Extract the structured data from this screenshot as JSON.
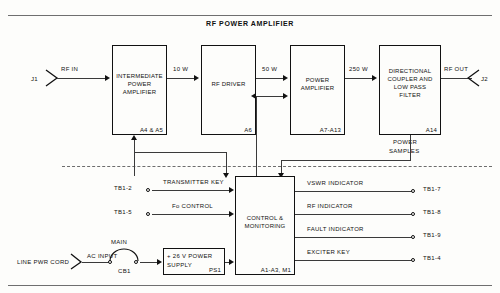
{
  "diagram": {
    "title": "RF POWER AMPLIFIER",
    "type": "block-diagram"
  },
  "signal_chain": {
    "input_connector": "J1",
    "input_label": "RF IN",
    "output_connector": "J2",
    "output_label": "RF OUT",
    "blocks": [
      {
        "id": "ipa",
        "name": "INTERMEDIATE\nPOWER\nAMPLIFIER",
        "line1": "INTERMEDIATE",
        "line2": "POWER",
        "line3": "AMPLIFIER",
        "designator": "A4 & A5"
      },
      {
        "id": "drv",
        "name": "RF DRIVER",
        "line1": "RF DRIVER",
        "line2": "",
        "line3": "",
        "designator": "A6"
      },
      {
        "id": "pa",
        "name": "POWER AMPLIFIER",
        "line1": "POWER",
        "line2": "AMPLIFIER",
        "line3": "",
        "designator": "A7-A13"
      },
      {
        "id": "dclp",
        "name": "DIRECTIONAL COUPLER AND LOW PASS FILTER",
        "line1": "DIRECTIONAL",
        "line2": "COUPLER AND",
        "line3": "LOW PASS",
        "line4": "FILTER",
        "designator": "A14"
      }
    ],
    "power_levels": [
      "10 W",
      "50 W",
      "250 W"
    ],
    "power_samples_label": "POWER\nSAMPLES",
    "power_samples_line1": "POWER",
    "power_samples_line2": "SAMPLES"
  },
  "control_section": {
    "block": {
      "line1": "CONTROL &",
      "line2": "MONITORING",
      "designator": "A1-A3, M1"
    },
    "inputs": [
      {
        "terminal": "TB1-2",
        "signal": "TRANSMITTER KEY"
      },
      {
        "terminal": "TB1-5",
        "signal": "Fo CONTROL"
      }
    ],
    "outputs": [
      {
        "terminal": "TB1-7",
        "signal": "VSWR INDICATOR"
      },
      {
        "terminal": "TB1-8",
        "signal": "RF INDICATOR"
      },
      {
        "terminal": "TB1-9",
        "signal": "FAULT INDICATOR"
      },
      {
        "terminal": "TB1-4",
        "signal": "EXCITER KEY"
      }
    ]
  },
  "power_section": {
    "line_cord": "LINE PWR CORD",
    "ac_input": "AC INPUT",
    "breaker_label": "MAIN",
    "breaker_designator": "CB1",
    "supply_line1": "+ 26 V POWER",
    "supply_line2": "SUPPLY",
    "supply_designator": "PS1"
  }
}
